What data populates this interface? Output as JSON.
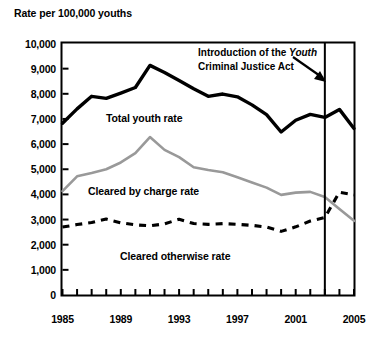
{
  "chart_data": {
    "type": "line",
    "title": "",
    "ylabel": "Rate per 100,000 youths",
    "xlabel": "",
    "ylim": [
      0,
      10000
    ],
    "xlim": [
      1985,
      2005
    ],
    "grid": false,
    "legend": "inline-labels",
    "y_ticks": [
      "10,000",
      "9,000",
      "8,000",
      "7,000",
      "6,000",
      "5,000",
      "4,000",
      "3,000",
      "2,000",
      "1,000",
      "0"
    ],
    "y_tick_values": [
      10000,
      9000,
      8000,
      7000,
      6000,
      5000,
      4000,
      3000,
      2000,
      1000,
      0
    ],
    "x_ticks": [
      "1985",
      "1989",
      "1993",
      "1997",
      "2001",
      "2005"
    ],
    "x_tick_values": [
      1985,
      1989,
      1993,
      1997,
      2001,
      2005
    ],
    "x": [
      1985,
      1986,
      1987,
      1988,
      1989,
      1990,
      1991,
      1992,
      1993,
      1994,
      1995,
      1996,
      1997,
      1998,
      1999,
      2000,
      2001,
      2002,
      2003,
      2004,
      2005
    ],
    "series": [
      {
        "name": "Total youth rate",
        "style": "thick-solid-black",
        "color": "#000000",
        "values": [
          6830,
          7400,
          7900,
          7820,
          8030,
          8250,
          9130,
          8850,
          8530,
          8200,
          7900,
          7990,
          7880,
          7560,
          7170,
          6480,
          6950,
          7180,
          7060,
          7380,
          6620
        ]
      },
      {
        "name": "Cleared by charge rate",
        "style": "solid-gray",
        "color": "#999999",
        "values": [
          4130,
          4720,
          4850,
          5000,
          5270,
          5640,
          6280,
          5770,
          5480,
          5080,
          4970,
          4880,
          4680,
          4470,
          4270,
          3980,
          4070,
          4100,
          3900,
          3420,
          2950
        ]
      },
      {
        "name": "Cleared otherwise rate",
        "style": "dashed-black",
        "color": "#000000",
        "values": [
          2700,
          2800,
          2880,
          3020,
          2870,
          2790,
          2750,
          2830,
          3010,
          2840,
          2810,
          2840,
          2810,
          2770,
          2700,
          2530,
          2710,
          2940,
          3080,
          4090,
          3980
        ]
      }
    ],
    "annotations": [
      {
        "name": "ycja-annotation",
        "text_line1_plain": "Introduction of the ",
        "text_line1_italic": "Youth",
        "text_line2_italic": "Criminal Justice Act",
        "points_to_year": 2003
      }
    ],
    "vertical_marker": {
      "name": "ycja-marker-line",
      "year": 2003
    }
  },
  "labels": {
    "total_youth_rate": "Total youth rate",
    "cleared_by_charge_rate": "Cleared by charge rate",
    "cleared_otherwise_rate": "Cleared otherwise rate"
  }
}
